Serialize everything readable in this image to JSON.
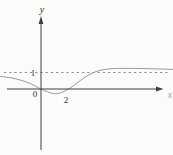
{
  "figure": {
    "background": "#fbfbf9",
    "axis_color": "#3f3f3f",
    "curve_color": "#9a9a9a",
    "asymptote_color": "#8c8c8c",
    "label_color": "#2f2f2f",
    "x_label_color": "#a9a49e",
    "labels": {
      "y_axis": "y",
      "x_axis": "x",
      "origin": "0",
      "x_tick": "2",
      "y_tick": "1"
    }
  },
  "chart_data": {
    "type": "line",
    "title": "",
    "xlabel": "x",
    "ylabel": "y",
    "x_tick_labels": [
      "0",
      "2"
    ],
    "y_tick_labels": [
      "1"
    ],
    "x_intercepts": [
      0,
      2
    ],
    "local_minimum": [
      1.04,
      -0.29
    ],
    "asymptote": {
      "y": 1,
      "style": "dashed",
      "x_start": -2.74,
      "x_end": 9.41
    },
    "xlim": [
      -3.04,
      9.78
    ],
    "ylim": [
      -4.0,
      4.4
    ],
    "grid": false,
    "legend": null,
    "series": [
      {
        "name": "f(x)",
        "points": [
          [
            -3.04,
            0.77
          ],
          [
            -2.0,
            0.64
          ],
          [
            -0.96,
            0.39
          ],
          [
            0.0,
            0.0
          ],
          [
            0.52,
            -0.18
          ],
          [
            1.04,
            -0.29
          ],
          [
            1.56,
            -0.2
          ],
          [
            2.04,
            0.0
          ],
          [
            2.6,
            0.32
          ],
          [
            3.19,
            0.68
          ],
          [
            3.78,
            0.96
          ],
          [
            4.37,
            1.13
          ],
          [
            5.11,
            1.22
          ],
          [
            6.0,
            1.25
          ],
          [
            7.33,
            1.24
          ],
          [
            8.52,
            1.22
          ],
          [
            9.78,
            1.19
          ]
        ]
      }
    ],
    "layout": {
      "origin_px": [
        41,
        89
      ],
      "px_per_unit": [
        13.5,
        16.5
      ],
      "x_axis_px": {
        "x1": 7,
        "x2": 156,
        "arrow_tip_x": 163.5
      },
      "y_axis_px": {
        "y1": 150,
        "y2": 24,
        "arrow_tip_y": 16
      }
    }
  }
}
